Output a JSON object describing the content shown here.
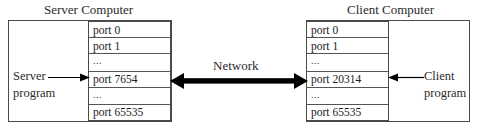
{
  "diagram": {
    "server": {
      "title": "Server Computer",
      "program_lines": [
        "Server",
        "program"
      ],
      "ports": [
        {
          "label": "port 0",
          "kind": "port"
        },
        {
          "label": "port 1",
          "kind": "port"
        },
        {
          "label": "...",
          "kind": "ellipsis"
        },
        {
          "label": "port 7654",
          "kind": "port"
        },
        {
          "label": "...",
          "kind": "ellipsis"
        },
        {
          "label": "port 65535",
          "kind": "port"
        }
      ],
      "highlighted_port": "port 7654"
    },
    "client": {
      "title": "Client Computer",
      "program_lines": [
        "Client",
        "program"
      ],
      "ports": [
        {
          "label": "port 0",
          "kind": "port"
        },
        {
          "label": "port 1",
          "kind": "port"
        },
        {
          "label": "...",
          "kind": "ellipsis"
        },
        {
          "label": "port 20314",
          "kind": "port"
        },
        {
          "label": "...",
          "kind": "ellipsis"
        },
        {
          "label": "port 65535",
          "kind": "port"
        }
      ],
      "highlighted_port": "port 20314"
    },
    "network": {
      "label": "Network",
      "arrow": "double-headed-horizontal-arrow"
    },
    "colors": {
      "stroke": "#4a4a4a",
      "text": "#1a1a1a",
      "background": "#ffffff",
      "arrow": "#000000"
    }
  }
}
